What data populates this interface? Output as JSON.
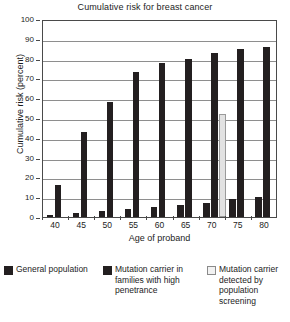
{
  "chart_data": {
    "type": "bar",
    "title": "Cumulative risk for breast cancer",
    "xlabel": "Age of proband",
    "ylabel": "Cumulative risk (percent)",
    "categories": [
      "40",
      "45",
      "50",
      "55",
      "60",
      "65",
      "70",
      "75",
      "80"
    ],
    "ylim": [
      0,
      100
    ],
    "ytick_labels": [
      "0",
      "10",
      "20",
      "30",
      "40",
      "50",
      "60",
      "70",
      "80",
      "90",
      "100"
    ],
    "grid": true,
    "legend_position": "below",
    "series": [
      {
        "name": "General population",
        "color": "#231f20",
        "values": [
          1,
          2,
          3,
          4,
          5,
          6,
          7,
          9,
          10
        ]
      },
      {
        "name": "Mutation carrier in families with high penetrance",
        "color": "#231f20",
        "values": [
          16,
          43,
          58,
          73,
          78,
          80,
          83,
          85,
          86
        ]
      },
      {
        "name": "Mutation carrier detected by population screening",
        "color": "#e2e2e2",
        "values": [
          null,
          null,
          null,
          null,
          null,
          null,
          52,
          null,
          null
        ]
      }
    ]
  },
  "legend": {
    "items": [
      {
        "label": "General population",
        "swatch": "dark"
      },
      {
        "label": "Mutation carrier in families with high penetrance",
        "swatch": "dark"
      },
      {
        "label": "Mutation carrier detected by population screening",
        "swatch": "light"
      }
    ]
  }
}
